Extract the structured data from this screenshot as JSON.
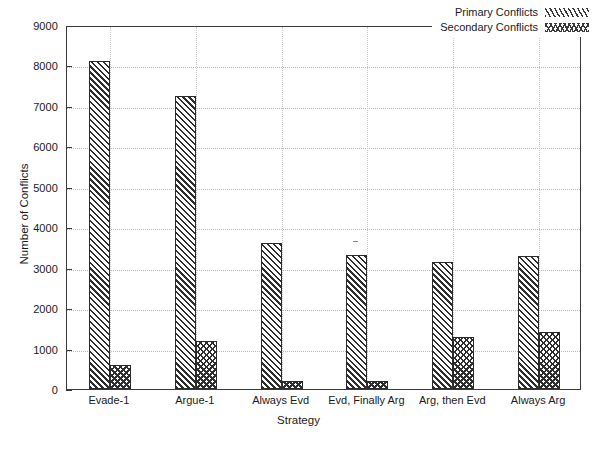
{
  "chart_data": {
    "type": "bar",
    "title": "",
    "xlabel": "Strategy",
    "ylabel": "Number of Conflicts",
    "categories": [
      "Evade-1",
      "Argue-1",
      "Always Evd",
      "Evd, Finally Arg",
      "Arg, then Evd",
      "Always Arg"
    ],
    "series": [
      {
        "name": "Primary Conflicts",
        "values": [
          8100,
          7250,
          3600,
          3320,
          3150,
          3300
        ]
      },
      {
        "name": "Secondary Conflicts",
        "values": [
          600,
          1180,
          200,
          200,
          1280,
          1400
        ]
      }
    ],
    "ylim": [
      0,
      9000
    ],
    "ytick_values": [
      0,
      1000,
      2000,
      3000,
      4000,
      5000,
      6000,
      7000,
      8000,
      9000
    ],
    "ytick_labels": [
      "0",
      "1000",
      "2000",
      "3000",
      "4000",
      "5000",
      "6000",
      "7000",
      "8000",
      "9000"
    ],
    "grid": true,
    "legend_position": "top-right"
  },
  "legend": {
    "items": [
      {
        "label": "Primary Conflicts",
        "swatch": "diagonal-hatch-swatch"
      },
      {
        "label": "Secondary Conflicts",
        "swatch": "zigzag-hatch-swatch"
      }
    ]
  }
}
